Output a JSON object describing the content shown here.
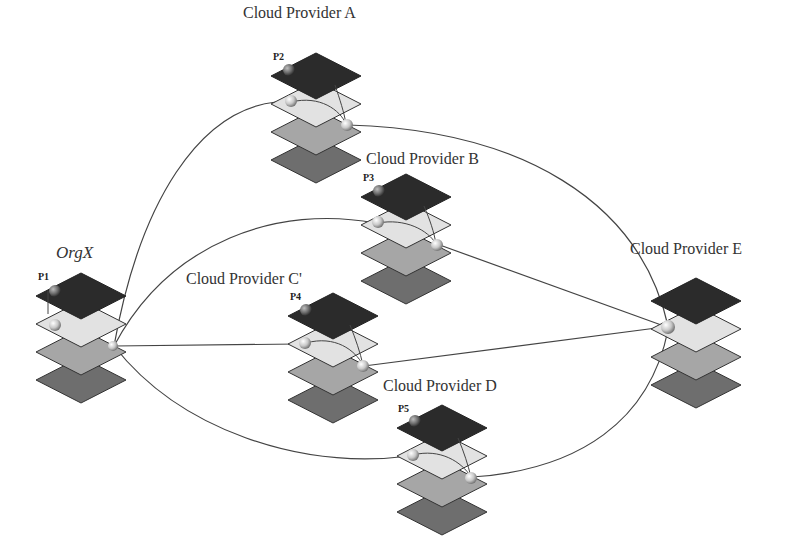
{
  "diagram": {
    "colors": {
      "layer1": "#2b2b2b",
      "layer2": "#e2e2e2",
      "layer3": "#a6a6a6",
      "layer4": "#6e6e6e",
      "edge": "#444444",
      "node": "#cfcfcf"
    },
    "nodes": [
      {
        "id": "orgx",
        "label": "OrgX",
        "plabel": "P1",
        "cx": 81,
        "top": 273,
        "label_x": 56,
        "label_y": 243,
        "italic": true
      },
      {
        "id": "cpA",
        "label": "Cloud Provider A",
        "plabel": "P2",
        "cx": 316,
        "top": 53,
        "label_x": 243,
        "label_y": 2,
        "italic": false
      },
      {
        "id": "cpB",
        "label": "Cloud Provider B",
        "plabel": "P3",
        "cx": 406,
        "top": 174,
        "label_x": 366,
        "label_y": 147,
        "italic": false
      },
      {
        "id": "cpC",
        "label": "Cloud Provider C'",
        "plabel": "P4",
        "cx": 333,
        "top": 293,
        "label_x": 186,
        "label_y": 268,
        "italic": false
      },
      {
        "id": "cpD",
        "label": "Cloud Provider D",
        "plabel": "P5",
        "cx": 442,
        "top": 405,
        "label_x": 383,
        "label_y": 375,
        "italic": false
      },
      {
        "id": "cpE",
        "label": "Cloud Provider E",
        "plabel": "",
        "cx": 696,
        "top": 278,
        "label_x": 630,
        "label_y": 238,
        "italic": false
      }
    ],
    "edges": [
      {
        "from": "orgx",
        "to": "cpA"
      },
      {
        "from": "orgx",
        "to": "cpB"
      },
      {
        "from": "orgx",
        "to": "cpC"
      },
      {
        "from": "orgx",
        "to": "cpD"
      },
      {
        "from": "cpA",
        "to": "cpE"
      },
      {
        "from": "cpB",
        "to": "cpE"
      },
      {
        "from": "cpC",
        "to": "cpE"
      },
      {
        "from": "cpD",
        "to": "cpE"
      }
    ]
  }
}
